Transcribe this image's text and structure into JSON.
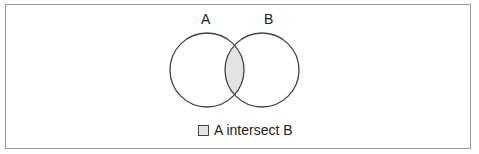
{
  "diagram": {
    "type": "venn",
    "sets": [
      {
        "label": "A"
      },
      {
        "label": "B"
      }
    ],
    "highlighted_region": "A ∩ B",
    "colors": {
      "fill": "#e3e3e3",
      "stroke": "#444444",
      "frame": "#9a9a9a"
    }
  },
  "labels": {
    "a": "A",
    "b": "B"
  },
  "legend": {
    "text": "A intersect B"
  }
}
